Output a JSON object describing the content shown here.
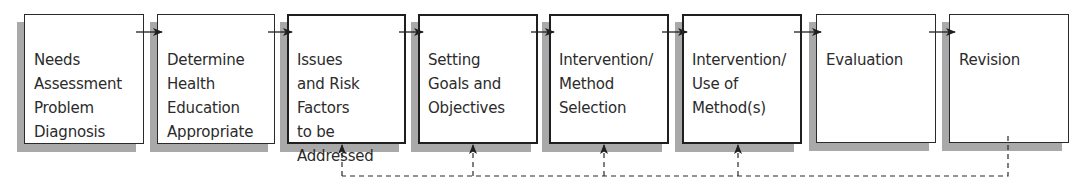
{
  "diagram": {
    "type": "flowchart",
    "direction": "left-to-right",
    "colors": {
      "border": "#2a2a2a",
      "shadow": "#a9a9a9",
      "text": "#2b2b2b",
      "background": "#ffffff"
    },
    "steps": [
      {
        "id": "needs-assessment",
        "label": "Needs\nAssessment\nProblem\nDiagnosis"
      },
      {
        "id": "determine-health-education",
        "label": "Determine\nHealth\nEducation\nAppropriate"
      },
      {
        "id": "issues-risk-factors",
        "label": "Issues\nand Risk\nFactors\nto be\nAddressed"
      },
      {
        "id": "setting-goals",
        "label": "Setting\nGoals and\nObjectives"
      },
      {
        "id": "intervention-method-selection",
        "label": "Intervention/\nMethod\nSelection"
      },
      {
        "id": "intervention-use-of-methods",
        "label": "Intervention/\nUse of\nMethod(s)"
      },
      {
        "id": "evaluation",
        "label": "Evaluation"
      },
      {
        "id": "revision",
        "label": "Revision"
      }
    ],
    "flow_arrows": [
      {
        "from": "needs-assessment",
        "to": "determine-health-education",
        "style": "solid"
      },
      {
        "from": "determine-health-education",
        "to": "issues-risk-factors",
        "style": "solid"
      },
      {
        "from": "issues-risk-factors",
        "to": "setting-goals",
        "style": "solid"
      },
      {
        "from": "setting-goals",
        "to": "intervention-method-selection",
        "style": "solid"
      },
      {
        "from": "intervention-method-selection",
        "to": "intervention-use-of-methods",
        "style": "solid"
      },
      {
        "from": "intervention-use-of-methods",
        "to": "evaluation",
        "style": "solid"
      },
      {
        "from": "evaluation",
        "to": "revision",
        "style": "solid"
      }
    ],
    "feedback_loop": {
      "from": "revision",
      "to": [
        "issues-risk-factors",
        "setting-goals",
        "intervention-method-selection",
        "intervention-use-of-methods"
      ],
      "style": "dashed"
    }
  }
}
